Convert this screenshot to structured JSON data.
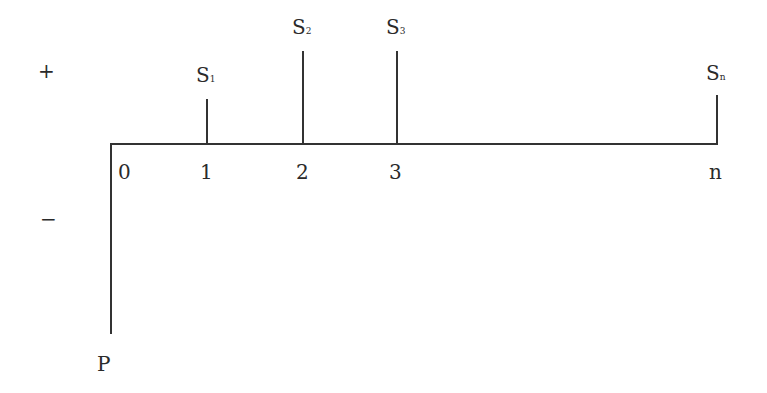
{
  "diagram": {
    "type": "cash-flow-timeline",
    "signs": {
      "positive": "+",
      "negative": "−"
    },
    "origin_label": "0",
    "outflow": {
      "label": "P",
      "at": "0"
    },
    "inflows": [
      {
        "period": "1",
        "label_main": "S",
        "label_sub": "1"
      },
      {
        "period": "2",
        "label_main": "S",
        "label_sub": "2"
      },
      {
        "period": "3",
        "label_main": "S",
        "label_sub": "3"
      },
      {
        "period": "n",
        "label_main": "S",
        "label_sub": "n"
      }
    ]
  }
}
